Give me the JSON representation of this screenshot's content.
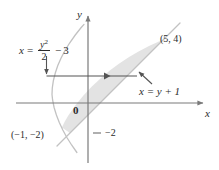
{
  "figure": {
    "background": "#ffffff",
    "shade_fill": "#e3e3e3",
    "curve_color": "#bdbdbd",
    "axis_color": "#7a7a7a",
    "text_color": "#2b2b2b",
    "arrow_color": "#545454"
  },
  "axes": {
    "x_label": "x",
    "y_label": "y",
    "origin_label": "0",
    "origin_px": {
      "x": 88,
      "y": 103
    },
    "unit_px": 15,
    "x_axis_y_px": 103,
    "y_axis_x_px": 88,
    "ticks": [
      {
        "axis": "y",
        "value": -2,
        "label": "−2",
        "y_px": 133
      }
    ]
  },
  "curves": [
    {
      "name": "parabola",
      "equation_text": "x = y²/2 − 3",
      "label_parts": {
        "lhs": "x",
        "equals": "=",
        "numerator": "y",
        "numerator_exp": "2",
        "denominator": "2",
        "minus": "−",
        "constant": "3"
      },
      "vertex": {
        "x": -3,
        "y": 0
      },
      "y_range": [
        -3.2,
        4.6
      ]
    },
    {
      "name": "line",
      "equation_text": "x = y + 1",
      "slope_form": "x = y + 1",
      "y_range": [
        -3.4,
        5.0
      ]
    }
  ],
  "points": [
    {
      "label": "(5, 4)",
      "x": 5,
      "y": 4
    },
    {
      "label": "(−1, −2)",
      "x": -1,
      "y": -2
    }
  ],
  "annotations": [
    {
      "name": "parabola-pointer",
      "type": "arrow",
      "description": "vertical arrow from equation label down to parabola boundary"
    },
    {
      "name": "horizontal-strip-arrow",
      "type": "double-arrow",
      "description": "horizontal arrow across region from parabola to line at y = 2"
    },
    {
      "name": "line-pointer",
      "type": "arrow",
      "description": "leader line from x = y + 1 label up-left to the line"
    }
  ],
  "region": {
    "name": "shaded-region",
    "description": "region between x = y²/2 − 3 and x = y + 1 from y = −2 to y = 4"
  }
}
